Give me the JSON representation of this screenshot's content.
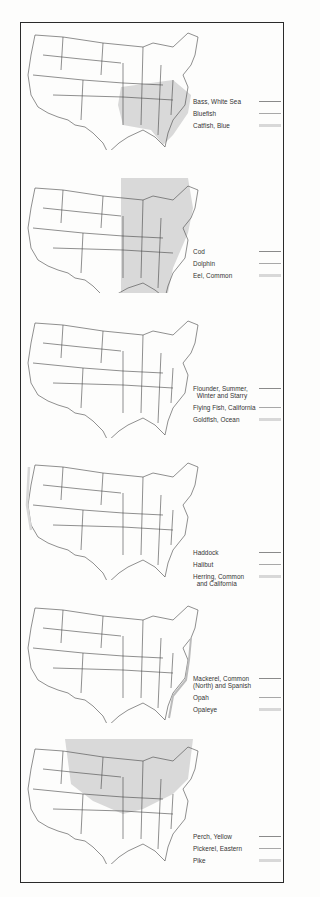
{
  "page": {
    "colors": {
      "frame": "#2a2a2a",
      "map_stroke": "#444444",
      "shade": "#d9d9d9",
      "line_dark": "#8a8a8a",
      "line_mid": "#a8a8a8",
      "line_light": "#d8d8d8"
    }
  },
  "panels": [
    {
      "shade_region": "southeast",
      "legend": [
        {
          "label": "Bass, White Sea",
          "style": "dark"
        },
        {
          "label": "Bluefish",
          "style": "mid"
        },
        {
          "label": "Catfish, Blue",
          "style": "light"
        }
      ]
    },
    {
      "shade_region": "east",
      "legend": [
        {
          "label": "Cod",
          "style": "dark"
        },
        {
          "label": "Dolphin",
          "style": "mid"
        },
        {
          "label": "Eel, Common",
          "style": "light"
        }
      ]
    },
    {
      "shade_region": "none",
      "legend": [
        {
          "label": "Flounder, Summer,\n  Winter and Starry",
          "style": "dark"
        },
        {
          "label": "Flying Fish, California",
          "style": "mid"
        },
        {
          "label": "Goldfish, Ocean",
          "style": "light"
        }
      ]
    },
    {
      "shade_region": "none",
      "legend": [
        {
          "label": "Haddock",
          "style": "dark"
        },
        {
          "label": "Halibut",
          "style": "mid"
        },
        {
          "label": "Herring, Common\n  and California",
          "style": "light"
        }
      ]
    },
    {
      "shade_region": "none",
      "legend": [
        {
          "label": "Mackerel, Common\n(North) and Spanish",
          "style": "dark"
        },
        {
          "label": "Opah",
          "style": "mid"
        },
        {
          "label": "Opaleye",
          "style": "light"
        }
      ]
    },
    {
      "shade_region": "north",
      "legend": [
        {
          "label": "Perch, Yellow",
          "style": "dark"
        },
        {
          "label": "Pickerel, Eastern",
          "style": "mid"
        },
        {
          "label": "Pike",
          "style": "light"
        }
      ]
    }
  ]
}
